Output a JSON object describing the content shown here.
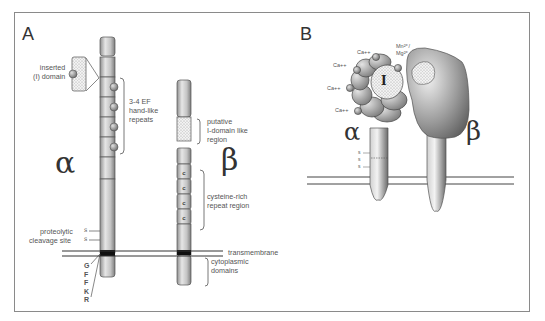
{
  "panel_a": {
    "letter": "A",
    "alpha_symbol": "α",
    "beta_symbol": "β",
    "labels": {
      "inserted_domain": "inserted\n(I) domain",
      "ef_hand": "3-4 EF\nhand-like\nrepeats",
      "proteolytic": "proteolytic",
      "cleavage": "cleavage site",
      "s1": "s",
      "s2": "s",
      "putative": "putative\nI-domain like\nregion",
      "cysteine": "cysteine-rich\nrepeat region",
      "transmembrane": "transmembrane",
      "cytoplasmic": "cytoplasmic\ndomains",
      "motif": [
        "G",
        "F",
        "F",
        "K",
        "R"
      ],
      "c_repeats": [
        "c",
        "c",
        "c",
        "c"
      ]
    }
  },
  "panel_b": {
    "letter": "B",
    "alpha_symbol": "α",
    "beta_symbol": "β",
    "i_domain": "I",
    "ions": [
      "Ca++",
      "Ca++",
      "Ca++",
      "Ca++"
    ],
    "mn_mg": "Mn²⁺/\nMg²⁺",
    "s_marks": [
      "s",
      "s",
      "s"
    ]
  },
  "colors": {
    "border": "#8a8a8a",
    "chain_light": "#e8e8e8",
    "chain_dark": "#9a9a9a",
    "membrane": "#333333",
    "tm_band": "#111111",
    "ion": "#888888"
  }
}
